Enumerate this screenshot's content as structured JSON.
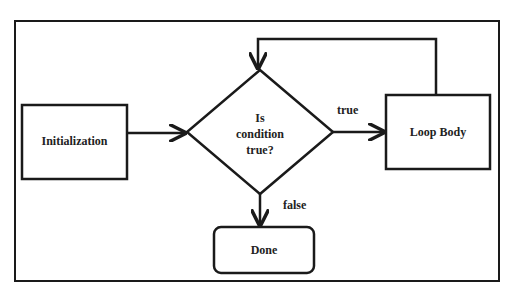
{
  "diagram": {
    "type": "flowchart",
    "colors": {
      "stroke": "#1a1a1a",
      "text": "#222222",
      "background": "#ffffff"
    },
    "nodes": {
      "init": {
        "label": "Initialization",
        "shape": "rectangle"
      },
      "condition": {
        "label_lines": [
          "Is",
          "condition",
          "true?"
        ],
        "shape": "diamond"
      },
      "loop_body": {
        "label": "Loop Body",
        "shape": "rectangle"
      },
      "done": {
        "label": "Done",
        "shape": "rounded-rectangle"
      }
    },
    "edges": {
      "true_label": "true",
      "false_label": "false"
    },
    "edge_list": [
      {
        "from": "init",
        "to": "condition",
        "label": ""
      },
      {
        "from": "condition",
        "to": "loop_body",
        "label": "true"
      },
      {
        "from": "loop_body",
        "to": "condition",
        "label": ""
      },
      {
        "from": "condition",
        "to": "done",
        "label": "false"
      }
    ]
  }
}
